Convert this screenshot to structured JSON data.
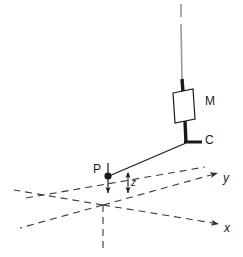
{
  "figure": {
    "labels": {
      "mass": "M",
      "clamp": "C",
      "point": "P",
      "axis_y": "y",
      "axis_x": "x",
      "height": "z"
    },
    "icons": {
      "mass_block": "rectangle-block-icon",
      "point_marker": "filled-dot-icon",
      "down_arrow": "down-arrow-icon",
      "dimension_arrow": "double-headed-vertical-arrow-icon",
      "axis_arrow_y": "arrowhead-icon",
      "axis_arrow_x": "arrowhead-icon",
      "break_mark": "line-break-icon"
    },
    "colors": {
      "stroke": "#1a1a1a",
      "dashed_stroke": "#4d4d4d",
      "wire": "#8c8c8c",
      "fill": "#ffffff",
      "background": "#ffffff"
    },
    "geometry": {
      "origin": [
        103,
        205
      ],
      "point_P": [
        108,
        176
      ],
      "clamp_C": [
        196,
        142
      ],
      "mass_center": [
        185,
        104
      ],
      "wire_top": [
        181,
        6
      ]
    }
  }
}
